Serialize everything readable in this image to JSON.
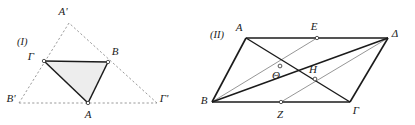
{
  "figures": [
    {
      "tag": "(I)",
      "tag_pos": {
        "x": 17,
        "y": 45
      },
      "description": "triangle with medial construction and dashed outer triangle",
      "fill_color": "#eeeeee",
      "stroke_color": "#1b1b1b",
      "dash_color": "#8a8a8a",
      "solid_triangle": [
        "Γ",
        "B",
        "A"
      ],
      "dashed_triangle": [
        "A'",
        "B'",
        "Γ'"
      ],
      "points": [
        {
          "label": "A'",
          "x": 69,
          "y": 23,
          "lx": 63,
          "ly": 15,
          "marker": false
        },
        {
          "label": "Γ",
          "x": 44,
          "y": 61,
          "lx": 30,
          "ly": 58,
          "marker": true
        },
        {
          "label": "B",
          "x": 108,
          "y": 62,
          "lx": 112,
          "ly": 55,
          "marker": true
        },
        {
          "label": "A",
          "x": 88,
          "y": 103,
          "lx": 84,
          "ly": 117,
          "marker": true
        },
        {
          "label": "B'",
          "x": 19,
          "y": 103,
          "lx": 7,
          "ly": 101,
          "marker": false
        },
        {
          "label": "Γ'",
          "x": 157,
          "y": 103,
          "lx": 160,
          "ly": 101,
          "marker": false
        }
      ]
    },
    {
      "tag": "(II)",
      "tag_pos": {
        "x": 210,
        "y": 38
      },
      "description": "parallelogram with diagonals and cevians",
      "stroke_color": "#1b1b1b",
      "thin_color": "#7d7d7d",
      "parallelogram": [
        "A",
        "Δ",
        "Γ",
        "B"
      ],
      "points": [
        {
          "label": "A",
          "x": 246,
          "y": 38,
          "lx": 239,
          "ly": 31,
          "marker": false
        },
        {
          "label": "E",
          "x": 317,
          "y": 38,
          "lx": 313,
          "ly": 30,
          "marker": true
        },
        {
          "label": "Δ",
          "x": 388,
          "y": 38,
          "lx": 392,
          "ly": 36,
          "marker": false
        },
        {
          "label": "Θ",
          "x": 280,
          "y": 66,
          "lx": 275,
          "ly": 76,
          "marker": true
        },
        {
          "label": "H",
          "x": 315,
          "y": 79,
          "lx": 311,
          "ly": 73,
          "marker": true
        },
        {
          "label": "B",
          "x": 212,
          "y": 102,
          "lx": 202,
          "ly": 102,
          "marker": false
        },
        {
          "label": "Z",
          "x": 281,
          "y": 102,
          "lx": 277,
          "ly": 118,
          "marker": true
        },
        {
          "label": "Γ",
          "x": 350,
          "y": 102,
          "lx": 354,
          "ly": 113,
          "marker": false
        }
      ]
    }
  ]
}
